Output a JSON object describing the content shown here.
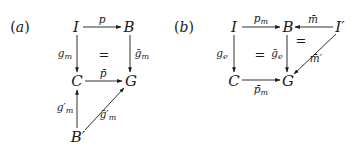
{
  "diagrams": [
    {
      "label": "(a)",
      "nodes": [
        {
          "id": "I",
          "text": "I"
        },
        {
          "id": "B",
          "text": "B"
        },
        {
          "id": "C",
          "text": "C"
        },
        {
          "id": "G",
          "text": "G"
        },
        {
          "id": "Bp",
          "text": "B′"
        }
      ],
      "arrows": [
        {
          "from": "I",
          "to": "B",
          "label": "p"
        },
        {
          "from": "I",
          "to": "C",
          "label": "g_m"
        },
        {
          "from": "B",
          "to": "G",
          "label": "ḡ_m"
        },
        {
          "from": "C",
          "to": "G",
          "label": "p̄"
        },
        {
          "from": "Bp",
          "to": "C",
          "label": "g′_m"
        },
        {
          "from": "Bp",
          "to": "G",
          "label": "ḡ′_m"
        }
      ],
      "equalities": [
        "="
      ]
    },
    {
      "label": "(b)",
      "nodes": [
        {
          "id": "I",
          "text": "I"
        },
        {
          "id": "B",
          "text": "B"
        },
        {
          "id": "Ip",
          "text": "I′"
        },
        {
          "id": "C",
          "text": "C"
        },
        {
          "id": "G",
          "text": "G"
        }
      ],
      "arrows": [
        {
          "from": "I",
          "to": "B",
          "label": "p_m"
        },
        {
          "from": "Ip",
          "to": "B",
          "label": "m̄"
        },
        {
          "from": "I",
          "to": "C",
          "label": "g_e"
        },
        {
          "from": "B",
          "to": "G",
          "label": "ḡ_e"
        },
        {
          "from": "C",
          "to": "G",
          "label": "p̄_m"
        },
        {
          "from": "Ip",
          "to": "G",
          "label": "m̄′"
        }
      ],
      "equalities": [
        "=",
        "="
      ]
    }
  ],
  "text": {
    "a_label_open": "(",
    "a_label_var": "a",
    "a_label_close": ")",
    "b_label_open": "(",
    "b_label_var": "b",
    "b_label_close": ")",
    "I": "I",
    "B": "B",
    "C": "C",
    "G": "G",
    "Bprime": "B′",
    "Iprime": "I′",
    "p": "p",
    "g": "g",
    "gbar": "ḡ",
    "pbar": "p̄",
    "m": "m",
    "e": "e",
    "gprime": "g′",
    "gbarprime": "ḡ′",
    "mbar": "m̄",
    "mbarprime": "m̄′",
    "eq": "="
  },
  "colors": {
    "ink": "#1a1a1a",
    "background": "#ffffff"
  }
}
